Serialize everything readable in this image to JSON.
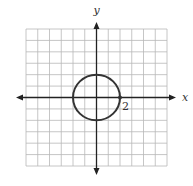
{
  "chart_data": {
    "type": "line",
    "title": "",
    "xlabel": "x",
    "ylabel": "y",
    "xlim": [
      -6,
      6
    ],
    "ylim": [
      -6,
      6
    ],
    "grid": true,
    "grid_step": 1,
    "series": [
      {
        "name": "circle",
        "shape": "circle",
        "center": [
          0,
          0
        ],
        "radius": 2,
        "equation": "x^2 + y^2 = 4"
      }
    ],
    "points": [
      {
        "x": 2,
        "y": 0,
        "label": "2"
      }
    ],
    "annotations": [
      {
        "text": "2",
        "x": 2,
        "y": 0
      }
    ],
    "colors": {
      "grid": "#b8b8b8",
      "axis": "#222222",
      "curve": "#333333"
    }
  }
}
